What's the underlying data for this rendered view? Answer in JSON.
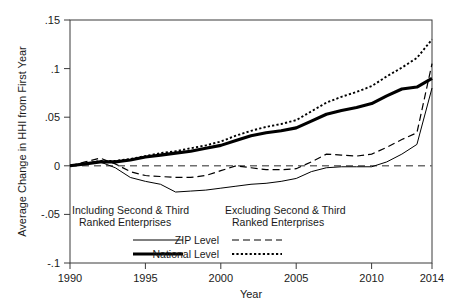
{
  "chart_data": {
    "type": "line",
    "title": "",
    "xlabel": "Year",
    "ylabel": "Average Change in HHI from First Year",
    "xlim": [
      1990,
      2014
    ],
    "ylim": [
      -0.1,
      0.15
    ],
    "grid": false,
    "xticks": [
      1990,
      1995,
      2000,
      2005,
      2010,
      2014
    ],
    "xtick_labels": [
      "1990",
      "1995",
      "2000",
      "2005",
      "2010",
      "2014"
    ],
    "yticks": [
      -0.1,
      -0.05,
      0,
      0.05,
      0.1,
      0.15
    ],
    "ytick_labels": [
      "-.1",
      "-.05",
      "0",
      ".05",
      ".1",
      ".15"
    ],
    "zero_reference_line": 0,
    "legend_position": "inside-lower-left",
    "legend_group_headers": [
      "Including Second & Third Ranked Enterprises",
      "Excluding Second & Third Ranked Enterprises"
    ],
    "legend_row_labels": [
      "ZIP Level",
      "National Level"
    ],
    "x": [
      1990,
      1991,
      1992,
      1993,
      1994,
      1995,
      1996,
      1997,
      1998,
      1999,
      2000,
      2001,
      2002,
      2003,
      2004,
      2005,
      2006,
      2007,
      2008,
      2009,
      2010,
      2011,
      2012,
      2013,
      2014
    ],
    "series": [
      {
        "name": "ZIP Level - Including Second & Third Ranked Enterprises",
        "style": "thin-solid",
        "color": "#000000",
        "values": [
          0.0,
          0.002,
          0.004,
          -0.002,
          -0.012,
          -0.016,
          -0.019,
          -0.027,
          -0.026,
          -0.025,
          -0.023,
          -0.021,
          -0.019,
          -0.018,
          -0.016,
          -0.013,
          -0.006,
          -0.002,
          -0.001,
          -0.001,
          -0.001,
          0.004,
          0.012,
          0.022,
          0.08
        ]
      },
      {
        "name": "National Level - Including Second & Third Ranked Enterprises",
        "style": "thick-solid",
        "color": "#000000",
        "values": [
          0.0,
          0.002,
          0.004,
          0.004,
          0.006,
          0.009,
          0.011,
          0.013,
          0.015,
          0.018,
          0.021,
          0.026,
          0.031,
          0.034,
          0.036,
          0.039,
          0.046,
          0.053,
          0.057,
          0.06,
          0.064,
          0.072,
          0.079,
          0.081,
          0.09
        ]
      },
      {
        "name": "ZIP Level - Excluding Second & Third Ranked Enterprises",
        "style": "dashed",
        "color": "#000000",
        "values": [
          0.0,
          0.004,
          0.008,
          0.002,
          -0.006,
          -0.01,
          -0.011,
          -0.012,
          -0.012,
          -0.01,
          -0.005,
          0.0,
          -0.002,
          -0.004,
          -0.004,
          -0.003,
          0.004,
          0.012,
          0.011,
          0.01,
          0.012,
          0.019,
          0.027,
          0.034,
          0.105
        ]
      },
      {
        "name": "National Level - Excluding Second & Third Ranked Enterprises",
        "style": "dotted",
        "color": "#000000",
        "values": [
          0.0,
          0.002,
          0.005,
          0.005,
          0.007,
          0.01,
          0.013,
          0.015,
          0.018,
          0.021,
          0.025,
          0.031,
          0.036,
          0.04,
          0.043,
          0.047,
          0.056,
          0.065,
          0.071,
          0.076,
          0.082,
          0.092,
          0.101,
          0.111,
          0.13
        ]
      }
    ]
  },
  "axes": {
    "x_axis_title": "Year",
    "y_axis_title": "Average Change in HHI from First Year"
  },
  "legend": {
    "header_left": "Including Second & Third",
    "header_left_2": "Ranked Enterprises",
    "header_right": "Excluding Second & Third",
    "header_right_2": "Ranked Enterprises",
    "row1_label": "ZIP Level",
    "row2_label": "National Level"
  }
}
